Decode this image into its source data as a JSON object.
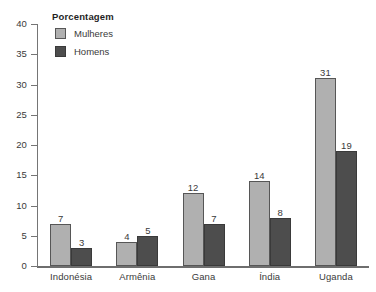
{
  "chart_data": {
    "type": "bar",
    "title": "",
    "subtitle": "",
    "xlabel": "",
    "ylabel": "",
    "ylim": [
      0,
      40
    ],
    "y_ticks": [
      0,
      5,
      10,
      15,
      20,
      25,
      30,
      35,
      40
    ],
    "y_tick_labels": [
      "0",
      "5",
      "10",
      "15",
      "20",
      "25",
      "30",
      "35",
      "40"
    ],
    "grid": false,
    "legend_position": "top-left",
    "legend_title": "Porcentagem",
    "categories": [
      "Indonésia",
      "Armênia",
      "Gana",
      "Índia",
      "Uganda"
    ],
    "series": [
      {
        "name": "Mulheres",
        "color": "#b0b0b0",
        "values": [
          7,
          4,
          12,
          14,
          31
        ],
        "labels": [
          "7",
          "4",
          "12",
          "14",
          "31"
        ]
      },
      {
        "name": "Homens",
        "color": "#4d4d4d",
        "values": [
          3,
          5,
          7,
          8,
          19
        ],
        "labels": [
          "3",
          "5",
          "7",
          "8",
          "19"
        ]
      }
    ]
  }
}
